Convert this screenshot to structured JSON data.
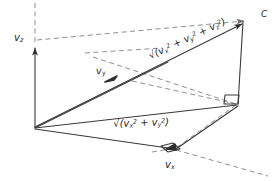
{
  "figure": {
    "background_color": "#ffffff",
    "stroke_color": "#3a3a3a",
    "dashed_color": "#8c8c8c",
    "width": 276,
    "height": 181
  },
  "labels": {
    "vz": {
      "name": "v",
      "subscript": "z"
    },
    "vy": {
      "name": "v",
      "subscript": "y"
    },
    "vx": {
      "name": "v",
      "subscript": "x"
    },
    "point_c": "C",
    "magnitude_3d": {
      "radical": "√(",
      "term1": "v",
      "term1_sub": "x",
      "term1_sup": "2",
      "op1": " + ",
      "term2": "v",
      "term2_sub": "y",
      "term2_sup": "2",
      "op2": " + ",
      "term3": "v",
      "term3_sub": "z",
      "term3_sup": "2",
      "close": ")"
    },
    "magnitude_2d": {
      "radical": "√(",
      "term1": "v",
      "term1_sub": "x",
      "term1_sup": "2",
      "op1": " + ",
      "term2": "v",
      "term2_sub": "y",
      "term2_sup": "2",
      "close": ")"
    }
  },
  "geometry": {
    "origin": {
      "x": 35,
      "y": 127
    },
    "point_c": {
      "x": 248,
      "y": 20
    },
    "point_c_base": {
      "x": 238,
      "y": 104
    },
    "point_vx": {
      "x": 176,
      "y": 148
    },
    "point_vz_tip": {
      "x": 35,
      "y": 45
    },
    "point_vy_arrow": {
      "x": 110,
      "y": 78
    }
  },
  "right_angles": [
    {
      "name": "right-angle-at-c-base",
      "x": 238,
      "y": 104
    },
    {
      "name": "right-angle-at-vx",
      "x": 176,
      "y": 148
    }
  ]
}
